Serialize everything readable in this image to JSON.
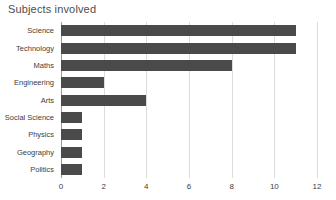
{
  "chart_data": {
    "type": "bar",
    "orientation": "horizontal",
    "title": "Subjects involved",
    "xlabel": "",
    "ylabel": "",
    "categories": [
      "Science",
      "Technology",
      "Maths",
      "Engineering",
      "Arts",
      "Social Science",
      "Physics",
      "Geography",
      "Politics"
    ],
    "values": [
      11,
      11,
      8,
      2,
      4,
      1,
      1,
      1,
      1
    ],
    "xticks": [
      "0",
      "2",
      "4",
      "6",
      "8",
      "10",
      "12"
    ],
    "xtick_values": [
      0,
      2,
      4,
      6,
      8,
      10,
      12
    ],
    "xlim": [
      0,
      12
    ],
    "grid": "vertical",
    "legend": "none",
    "bar_color": "#4a4a4a",
    "gridline_color": "#dcdcdc",
    "axis_color": "#9a9a9a",
    "title_color": "#4d4d4d",
    "label_color": "#3d3d3d",
    "background": "#ffffff"
  }
}
